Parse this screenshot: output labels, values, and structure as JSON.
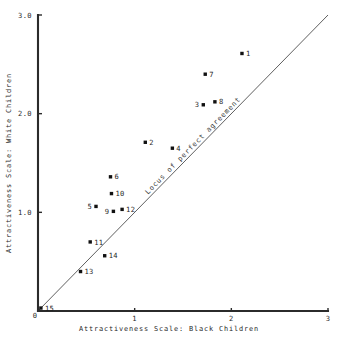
{
  "chart_data": {
    "type": "scatter",
    "title": "",
    "xlabel": "Attractiveness Scale:  Black Children",
    "ylabel": "Attractiveness Scale:  White Children",
    "xlim": [
      0,
      3
    ],
    "ylim": [
      0,
      3
    ],
    "xticks": [
      "0",
      "1",
      "2",
      "3"
    ],
    "xtick_values": [
      0,
      1,
      2,
      3
    ],
    "yticks": [
      "0",
      "1.0",
      "2.0",
      "3.0"
    ],
    "ytick_values": [
      0,
      1.0,
      2.0,
      3.0
    ],
    "grid": false,
    "legend": "none",
    "annotations": [
      {
        "name": "locus-of-perfect-agreement",
        "text": "Locus of perfect agreement",
        "kind": "reference-line-label"
      }
    ],
    "reference_line": {
      "name": "identity-line",
      "label": "Locus of perfect agreement",
      "from": [
        0,
        0
      ],
      "to": [
        3,
        3
      ]
    },
    "points": [
      {
        "label": "1",
        "x": 2.11,
        "y": 2.61,
        "label_side": "right"
      },
      {
        "label": "7",
        "x": 1.73,
        "y": 2.4,
        "label_side": "right"
      },
      {
        "label": "8",
        "x": 1.83,
        "y": 2.12,
        "label_side": "right"
      },
      {
        "label": "3",
        "x": 1.71,
        "y": 2.09,
        "label_side": "left"
      },
      {
        "label": "2",
        "x": 1.11,
        "y": 1.71,
        "label_side": "right"
      },
      {
        "label": "4",
        "x": 1.39,
        "y": 1.65,
        "label_side": "right"
      },
      {
        "label": "6",
        "x": 0.75,
        "y": 1.36,
        "label_side": "right"
      },
      {
        "label": "10",
        "x": 0.76,
        "y": 1.19,
        "label_side": "right"
      },
      {
        "label": "5",
        "x": 0.6,
        "y": 1.06,
        "label_side": "left"
      },
      {
        "label": "12",
        "x": 0.87,
        "y": 1.03,
        "label_side": "right"
      },
      {
        "label": "9",
        "x": 0.78,
        "y": 1.01,
        "label_side": "left"
      },
      {
        "label": "11",
        "x": 0.54,
        "y": 0.7,
        "label_side": "right"
      },
      {
        "label": "14",
        "x": 0.69,
        "y": 0.56,
        "label_side": "right"
      },
      {
        "label": "13",
        "x": 0.44,
        "y": 0.4,
        "label_side": "right"
      },
      {
        "label": "15",
        "x": 0.03,
        "y": 0.03,
        "label_side": "right"
      }
    ]
  },
  "colors": {
    "axis": "#2b2b2b",
    "marker": "#111111",
    "reference_line": "#4d4d4d",
    "text": "#1f1f1f",
    "background": "#ffffff"
  }
}
